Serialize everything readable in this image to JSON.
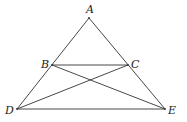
{
  "diagram": {
    "points": {
      "A": {
        "label": "A",
        "x": 89,
        "y": 18,
        "lx": 86,
        "ly": 13
      },
      "B": {
        "label": "B",
        "x": 52,
        "y": 65,
        "lx": 41,
        "ly": 68
      },
      "C": {
        "label": "C",
        "x": 128,
        "y": 65,
        "lx": 131,
        "ly": 68
      },
      "D": {
        "label": "D",
        "x": 17,
        "y": 109,
        "lx": 6,
        "ly": 114
      },
      "E": {
        "label": "E",
        "x": 165,
        "y": 109,
        "lx": 168,
        "ly": 114
      }
    },
    "segments": [
      "AD",
      "AE",
      "DE",
      "BC",
      "BE",
      "CD"
    ],
    "line_color": "#333333"
  }
}
